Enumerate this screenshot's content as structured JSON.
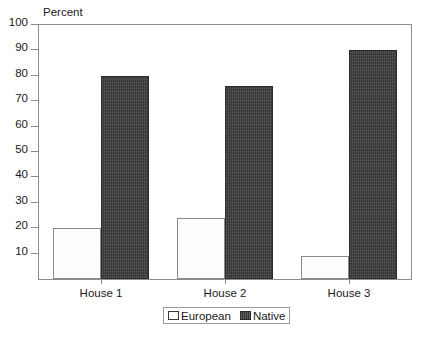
{
  "chart_data": {
    "type": "bar",
    "title": "",
    "subtitle": "",
    "ylabel": "Percent",
    "xlabel": "",
    "categories": [
      "House 1",
      "House 2",
      "House 3"
    ],
    "series": [
      {
        "name": "European",
        "values": [
          20,
          24,
          9
        ],
        "color": "#ffffff",
        "pattern": "solid-white-outline"
      },
      {
        "name": "Native",
        "values": [
          80,
          76,
          90
        ],
        "color": "#343434",
        "pattern": "dark-hatch"
      }
    ],
    "ylim": [
      0,
      100
    ],
    "yticks": [
      100,
      90,
      80,
      70,
      60,
      50,
      40,
      30,
      20,
      10
    ],
    "ytick_labels": [
      "100",
      "90",
      "80",
      "70",
      "60",
      "50",
      "40",
      "30",
      "20",
      "10"
    ],
    "grid": false,
    "legend_position": "bottom-center",
    "legend_entries": [
      "European",
      "Native"
    ],
    "annotations": []
  },
  "axis": {
    "y_title": "Percent"
  },
  "legend": {
    "items": [
      {
        "label": "European",
        "swatch": "legend-swatch-european"
      },
      {
        "label": "Native",
        "swatch": "legend-swatch-native"
      }
    ]
  }
}
